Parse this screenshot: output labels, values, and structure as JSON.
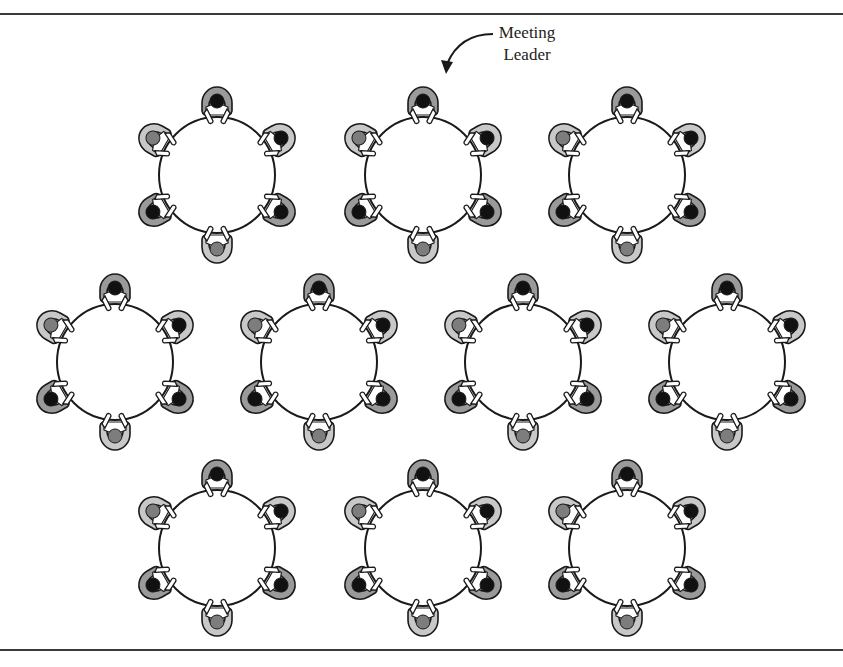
{
  "diagram": {
    "type": "seating-arrangement",
    "annotation": {
      "line1": "Meeting",
      "line2": "Leader",
      "points_to_table": 1,
      "points_to_seat": "top"
    },
    "table": {
      "shape": "circle",
      "radius": 58,
      "seats_per_table": 6
    },
    "tables": [
      {
        "id": 0,
        "row": 1,
        "cx": 217,
        "cy": 175
      },
      {
        "id": 1,
        "row": 1,
        "cx": 423,
        "cy": 175
      },
      {
        "id": 2,
        "row": 1,
        "cx": 627,
        "cy": 175
      },
      {
        "id": 3,
        "row": 2,
        "cx": 115,
        "cy": 362
      },
      {
        "id": 4,
        "row": 2,
        "cx": 319,
        "cy": 362
      },
      {
        "id": 5,
        "row": 2,
        "cx": 523,
        "cy": 362
      },
      {
        "id": 6,
        "row": 2,
        "cx": 727,
        "cy": 362
      },
      {
        "id": 7,
        "row": 3,
        "cx": 217,
        "cy": 548
      },
      {
        "id": 8,
        "row": 3,
        "cx": 423,
        "cy": 548
      },
      {
        "id": 9,
        "row": 3,
        "cx": 627,
        "cy": 548
      }
    ],
    "seats": [
      {
        "position": "top",
        "angle": -90,
        "chair": "dark",
        "head": "dark"
      },
      {
        "position": "upper-right",
        "angle": -30,
        "chair": "light",
        "head": "dark"
      },
      {
        "position": "lower-right",
        "angle": 30,
        "chair": "dark",
        "head": "dark"
      },
      {
        "position": "bottom",
        "angle": 90,
        "chair": "light",
        "head": "gray"
      },
      {
        "position": "lower-left",
        "angle": 150,
        "chair": "dark",
        "head": "dark"
      },
      {
        "position": "upper-left",
        "angle": 210,
        "chair": "light",
        "head": "gray"
      }
    ],
    "colors": {
      "line": "#1a1a1a",
      "chair_light": "#c8c8c8",
      "chair_dark": "#9a9a9a",
      "head_dark": "#111111",
      "head_gray": "#7d7d7d",
      "body": "#ffffff"
    }
  }
}
